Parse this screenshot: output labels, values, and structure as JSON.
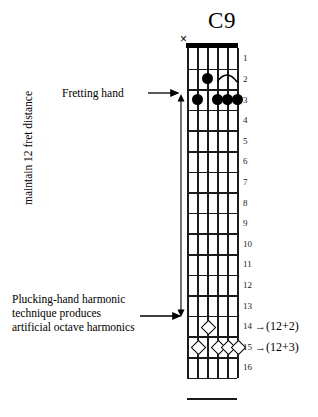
{
  "diagram": {
    "title": "C9",
    "instrument_strings": 6,
    "muted_string_marker": "×",
    "fret_numbers": [
      "1",
      "2",
      "3",
      "4",
      "5",
      "6",
      "7",
      "8",
      "9",
      "10",
      "11",
      "12",
      "13",
      "14",
      "15",
      "16"
    ],
    "measurement_label": "maintain 12 fret distance",
    "fretting_hand_label": "Fretting hand",
    "plucking_hand_label_lines": [
      "Plucking-hand harmonic",
      "technique produces",
      "artificial octave harmonics"
    ],
    "octave_annotations": [
      {
        "fret": "14",
        "arrow": "→",
        "text": "(12+2)"
      },
      {
        "fret": "15",
        "arrow": "→",
        "text": "(12+3)"
      }
    ],
    "fretted_notes": [
      {
        "string": 4,
        "fret": 2
      },
      {
        "string": 5,
        "fret": 3
      },
      {
        "string": 3,
        "fret": 3
      },
      {
        "string": 2,
        "fret": 3
      },
      {
        "string": 1,
        "fret": 3
      }
    ],
    "slur": {
      "fret": 2,
      "from_string": 3,
      "to_string": 1
    },
    "harmonic_notes": [
      {
        "string": 4,
        "fret": 14
      },
      {
        "string": 5,
        "fret": 15
      },
      {
        "string": 3,
        "fret": 15
      },
      {
        "string": 2,
        "fret": 15
      },
      {
        "string": 1,
        "fret": 15
      }
    ],
    "colors": {
      "ink": "#000000",
      "grid": "#1a1a1a",
      "paper": "#ffffff"
    }
  }
}
